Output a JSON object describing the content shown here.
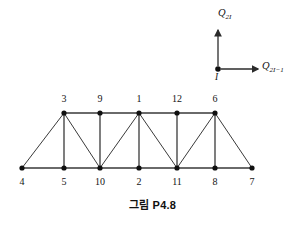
{
  "figure": {
    "caption": "그림 P4.8",
    "stroke_color": "#3a3a3a",
    "node_color": "#101010",
    "background": "#ffffff"
  },
  "coordinate_indicator": {
    "origin_label": "I",
    "vertical_axis_label_base": "Q",
    "vertical_axis_label_sub": "2I",
    "horizontal_axis_label_base": "Q",
    "horizontal_axis_label_sub": "2I−1",
    "origin_x": 218,
    "origin_y": 69,
    "vertical_arrow_tip_y": 30,
    "horizontal_arrow_tip_x": 258
  },
  "chart_data": {
    "type": "diagram",
    "title": "그림 P4.8",
    "subtitle": "",
    "top_chord_y": 113,
    "bottom_chord_y": 168,
    "nodes": [
      {
        "id": "3",
        "x": 64,
        "y": 113,
        "chord": "top",
        "label_dx": 0,
        "label_dy": -14
      },
      {
        "id": "9",
        "x": 100,
        "y": 113,
        "chord": "top",
        "label_dx": 0,
        "label_dy": -14
      },
      {
        "id": "1",
        "x": 139,
        "y": 113,
        "chord": "top",
        "label_dx": 0,
        "label_dy": -14
      },
      {
        "id": "12",
        "x": 177,
        "y": 113,
        "chord": "top",
        "label_dx": 0,
        "label_dy": -14
      },
      {
        "id": "6",
        "x": 215,
        "y": 113,
        "chord": "top",
        "label_dx": 0,
        "label_dy": -14
      },
      {
        "id": "4",
        "x": 22,
        "y": 168,
        "chord": "bottom",
        "label_dx": 0,
        "label_dy": 14
      },
      {
        "id": "5",
        "x": 64,
        "y": 168,
        "chord": "bottom",
        "label_dx": 0,
        "label_dy": 14
      },
      {
        "id": "10",
        "x": 100,
        "y": 168,
        "chord": "bottom",
        "label_dx": 0,
        "label_dy": 14
      },
      {
        "id": "2",
        "x": 139,
        "y": 168,
        "chord": "bottom",
        "label_dx": 0,
        "label_dy": 14
      },
      {
        "id": "11",
        "x": 177,
        "y": 168,
        "chord": "bottom",
        "label_dx": 0,
        "label_dy": 14
      },
      {
        "id": "8",
        "x": 215,
        "y": 168,
        "chord": "bottom",
        "label_dx": 0,
        "label_dy": 14
      },
      {
        "id": "7",
        "x": 252,
        "y": 168,
        "chord": "bottom",
        "label_dx": 0,
        "label_dy": 14
      }
    ],
    "members": [
      {
        "from": "3",
        "to": "9",
        "type": "top-chord"
      },
      {
        "from": "9",
        "to": "1",
        "type": "top-chord"
      },
      {
        "from": "1",
        "to": "12",
        "type": "top-chord"
      },
      {
        "from": "12",
        "to": "6",
        "type": "top-chord"
      },
      {
        "from": "4",
        "to": "5",
        "type": "bottom-chord"
      },
      {
        "from": "5",
        "to": "10",
        "type": "bottom-chord"
      },
      {
        "from": "10",
        "to": "2",
        "type": "bottom-chord"
      },
      {
        "from": "2",
        "to": "11",
        "type": "bottom-chord"
      },
      {
        "from": "11",
        "to": "8",
        "type": "bottom-chord"
      },
      {
        "from": "8",
        "to": "7",
        "type": "bottom-chord"
      },
      {
        "from": "3",
        "to": "5",
        "type": "vertical"
      },
      {
        "from": "9",
        "to": "10",
        "type": "vertical"
      },
      {
        "from": "1",
        "to": "2",
        "type": "vertical"
      },
      {
        "from": "12",
        "to": "11",
        "type": "vertical"
      },
      {
        "from": "6",
        "to": "8",
        "type": "vertical"
      },
      {
        "from": "3",
        "to": "4",
        "type": "diagonal"
      },
      {
        "from": "3",
        "to": "10",
        "type": "diagonal"
      },
      {
        "from": "1",
        "to": "10",
        "type": "diagonal"
      },
      {
        "from": "1",
        "to": "11",
        "type": "diagonal"
      },
      {
        "from": "6",
        "to": "11",
        "type": "diagonal"
      },
      {
        "from": "6",
        "to": "7",
        "type": "diagonal"
      }
    ],
    "node_count": 12,
    "member_count": 21
  }
}
